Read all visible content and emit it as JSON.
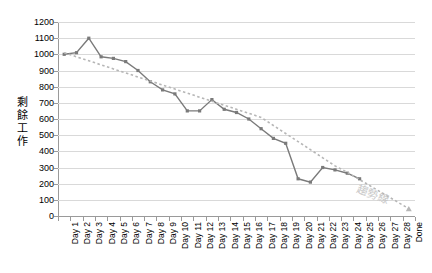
{
  "chart_data": {
    "type": "line",
    "title": "",
    "xlabel": "",
    "ylabel": "剩餘工作",
    "ylim": [
      0,
      1200
    ],
    "ytick_step": 100,
    "yticks": [
      1200,
      1100,
      1000,
      900,
      800,
      700,
      600,
      500,
      400,
      300,
      200,
      100,
      0
    ],
    "grid": true,
    "legend": false,
    "categories": [
      "Day 1",
      "Day 2",
      "Day 3",
      "Day 4",
      "Day 5",
      "Day 6",
      "Day 7",
      "Day 8",
      "Day 9",
      "Day 10",
      "Day 11",
      "Day 12",
      "Day 13",
      "Day 14",
      "Day 15",
      "Day 16",
      "Day 17",
      "Day 18",
      "Day 19",
      "Day 20",
      "Day 21",
      "Day 22",
      "Day 23",
      "Day 24",
      "Day 25",
      "Day 26",
      "Day 27",
      "Day 28",
      "Done"
    ],
    "series": [
      {
        "name": "剩餘工作",
        "style": "solid",
        "color": "#7a7a7a",
        "marker": "square",
        "values": [
          1000,
          1010,
          1100,
          985,
          975,
          955,
          900,
          830,
          780,
          755,
          650,
          650,
          720,
          660,
          640,
          600,
          540,
          480,
          450,
          230,
          210,
          300,
          285,
          265,
          230,
          null,
          null,
          null,
          null
        ]
      },
      {
        "name": "趨勢線",
        "style": "dashed",
        "color": "#b6b6b6",
        "marker": "triangle",
        "values": [
          1010,
          985,
          960,
          935,
          910,
          885,
          860,
          835,
          810,
          785,
          760,
          735,
          710,
          685,
          660,
          635,
          610,
          560,
          510,
          460,
          410,
          360,
          310,
          270,
          225,
          180,
          135,
          90,
          45
        ]
      }
    ],
    "annotations": [
      {
        "text": "趨勢線",
        "color": "#c7c7c7",
        "rotation": 20
      }
    ]
  }
}
